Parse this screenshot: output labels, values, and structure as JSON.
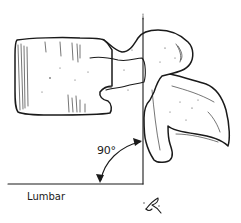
{
  "figure": {
    "angle_label": "90°",
    "region_label": "Lumbar",
    "signature": "artist-monogram",
    "colors": {
      "ink": "#1a1a1a",
      "background": "#ffffff"
    }
  }
}
